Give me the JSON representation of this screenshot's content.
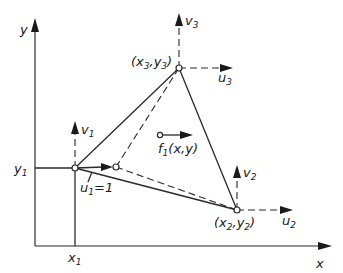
{
  "diagram": {
    "type": "finite-element-triangle",
    "axes": {
      "x_label": "x",
      "y_label": "y",
      "x_tick_label": "x",
      "x_tick_sub": "1",
      "y_tick_label": "y",
      "y_tick_sub": "1"
    },
    "nodes": [
      {
        "id": "1",
        "coord_label": "",
        "u_label": "u",
        "u_sub": "1",
        "u_value": "=1",
        "v_label": "v",
        "v_sub": "1"
      },
      {
        "id": "2",
        "coord_label_open": "(x",
        "coord_sub_a": "2",
        "coord_mid": ",y",
        "coord_sub_b": "2",
        "coord_close": ")",
        "u_label": "u",
        "u_sub": "2",
        "v_label": "v",
        "v_sub": "2"
      },
      {
        "id": "3",
        "coord_label_open": "(x",
        "coord_sub_a": "3",
        "coord_mid": ",y",
        "coord_sub_b": "3",
        "coord_close": ")",
        "u_label": "u",
        "u_sub": "3",
        "v_label": "v",
        "v_sub": "3"
      }
    ],
    "force": {
      "label": "f",
      "sub": "1",
      "args": "(x,y)"
    },
    "colors": {
      "line": "#2a2a2a",
      "background": "#ffffff"
    }
  }
}
